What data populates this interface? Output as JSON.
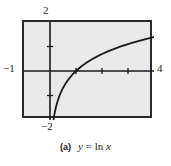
{
  "figure": {
    "caption_tag": "(a)",
    "caption_equation_y": "y",
    "caption_equation_eq": "=",
    "caption_equation_fn": "ln",
    "caption_equation_var": "x",
    "caption_full": "(a)  y = ln x",
    "background_color": "#ffffff",
    "plot_fill_color": "#e9e9e9",
    "frame_color": "#2b2b2b",
    "curve_color": "#1a1a1a"
  },
  "axis_labels": {
    "y_top": "2",
    "y_bottom": "−2",
    "x_left": "−1",
    "x_right": "4"
  },
  "chart_data": {
    "type": "line",
    "title": "",
    "subtitle": "",
    "xlabel": "",
    "ylabel": "",
    "function": "y = ln x",
    "xlim": [
      -1,
      4
    ],
    "ylim": [
      -2,
      2
    ],
    "grid": false,
    "legend": null,
    "x_ticks": [
      1,
      2,
      3
    ],
    "y_ticks": [
      -1,
      1
    ],
    "x_tick_labels_shown": [
      "−1",
      "4"
    ],
    "y_tick_labels_shown": [
      "2",
      "−2"
    ],
    "x_axis_y": 0,
    "y_axis_x": 0,
    "series": [
      {
        "name": "y = ln x",
        "x": [
          0.1353,
          0.16,
          0.19,
          0.23,
          0.28,
          0.34,
          0.41,
          0.5,
          0.6,
          0.72,
          0.85,
          1.0,
          1.2,
          1.4,
          1.6,
          1.8,
          2.0,
          2.25,
          2.5,
          2.75,
          3.0,
          3.25,
          3.5,
          3.75,
          4.0
        ],
        "y": [
          -2.0,
          -1.833,
          -1.661,
          -1.47,
          -1.273,
          -1.079,
          -0.892,
          -0.693,
          -0.511,
          -0.329,
          -0.163,
          0.0,
          0.182,
          0.336,
          0.47,
          0.588,
          0.693,
          0.811,
          0.916,
          1.012,
          1.099,
          1.179,
          1.253,
          1.322,
          1.386
        ]
      }
    ]
  }
}
